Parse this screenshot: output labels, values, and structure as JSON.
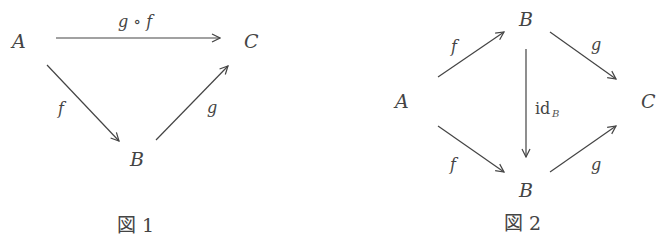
{
  "figure1": {
    "caption": "図 1",
    "objects": {
      "A": "A",
      "B": "B",
      "C": "C"
    },
    "arrows": [
      {
        "from": "A",
        "to": "C",
        "label": "g ∘ f"
      },
      {
        "from": "A",
        "to": "B",
        "label": "f"
      },
      {
        "from": "B",
        "to": "C",
        "label": "g"
      }
    ]
  },
  "figure2": {
    "caption": "図 2",
    "objects": {
      "A": "A",
      "B_top": "B",
      "B_bottom": "B",
      "C": "C"
    },
    "arrows": [
      {
        "from": "A",
        "to": "B_top",
        "label": "f"
      },
      {
        "from": "B_top",
        "to": "C",
        "label": "g"
      },
      {
        "from": "B_top",
        "to": "B_bottom",
        "label": "id",
        "label_sub": "B"
      },
      {
        "from": "A",
        "to": "B_bottom",
        "label": "f"
      },
      {
        "from": "B_bottom",
        "to": "C",
        "label": "g"
      }
    ]
  },
  "colors": {
    "ink": "#444444",
    "background": "#ffffff"
  }
}
